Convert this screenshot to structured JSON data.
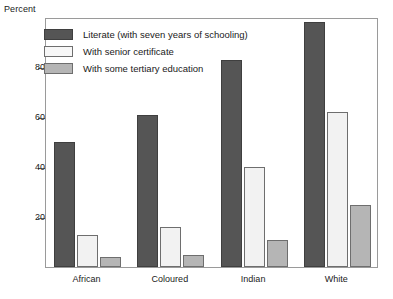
{
  "chart_data": {
    "type": "bar",
    "title": "",
    "subtitle": "",
    "xlabel": "",
    "ylabel": "Percent",
    "ylim": [
      0,
      100
    ],
    "yticks": [
      20,
      40,
      60,
      80
    ],
    "grid": false,
    "legend_position": "top-left",
    "categories": [
      "African",
      "Coloured",
      "Indian",
      "White"
    ],
    "series": [
      {
        "name": "Literate (with seven years of schooling)",
        "color": "#555555",
        "values": [
          50,
          61,
          83,
          98
        ]
      },
      {
        "name": "With senior certificate",
        "color": "#f2f2f2",
        "values": [
          13,
          16,
          40,
          62
        ]
      },
      {
        "name": "With some tertiary education",
        "color": "#b5b5b5",
        "values": [
          4,
          5,
          11,
          25
        ]
      }
    ]
  }
}
